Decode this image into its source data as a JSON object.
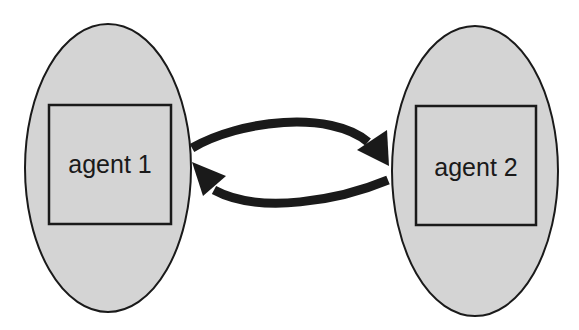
{
  "diagram": {
    "nodes": [
      {
        "id": "agent1",
        "label": "agent 1",
        "cx": 108,
        "cy": 168,
        "rx": 83,
        "ry": 144,
        "box": {
          "x": 49,
          "y": 105,
          "w": 122,
          "h": 119
        }
      },
      {
        "id": "agent2",
        "label": "agent 2",
        "cx": 475,
        "cy": 171,
        "rx": 83,
        "ry": 145,
        "box": {
          "x": 416,
          "y": 106,
          "w": 120,
          "h": 119
        }
      }
    ],
    "edges": [
      {
        "from": "agent1",
        "to": "agent2",
        "direction": "top arc, left to right"
      },
      {
        "from": "agent2",
        "to": "agent1",
        "direction": "bottom arc, right to left"
      }
    ],
    "colors": {
      "ellipse_fill": "#d4d4d4",
      "stroke": "#1a1a1a",
      "background": "#ffffff"
    }
  }
}
